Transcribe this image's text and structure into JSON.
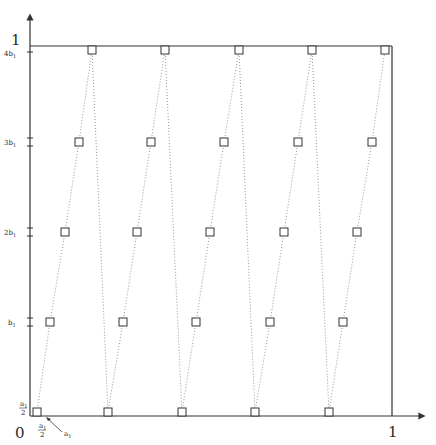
{
  "diagram": {
    "type": "unit-square sawtooth path diagram",
    "axes": {
      "origin_label": "0",
      "x_end_label": "1",
      "y_end_label": "1",
      "x_tick_label": "a1/2",
      "y_tick_label": "a1/2",
      "corner_pointer_label": "a1"
    },
    "y_levels": [
      {
        "label": "",
        "value": "a1/2"
      },
      {
        "label": "b1",
        "value": "b1"
      },
      {
        "label": "2b1",
        "value": "2b1"
      },
      {
        "label": "3b1",
        "value": "3b1"
      },
      {
        "label": "4b1",
        "value": "4b1"
      }
    ],
    "chains": [
      {
        "points_x": [
          37,
          50,
          65,
          79,
          92
        ]
      },
      {
        "points_x": [
          108,
          123,
          137,
          151,
          165
        ]
      },
      {
        "points_x": [
          182,
          196,
          210,
          224,
          239
        ]
      },
      {
        "points_x": [
          255,
          270,
          284,
          298,
          312
        ]
      },
      {
        "points_x": [
          329,
          343,
          357,
          372,
          385
        ]
      }
    ],
    "row_y": [
      412,
      322,
      232,
      142,
      50
    ],
    "colors": {
      "line": "#333333",
      "dotted": "#8a8a8a",
      "marker": "#333333"
    }
  }
}
